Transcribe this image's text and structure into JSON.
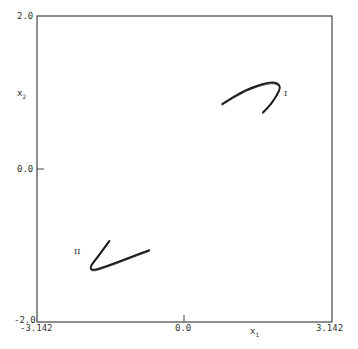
{
  "chart_data": {
    "type": "line",
    "title": "",
    "xlabel": "x1",
    "ylabel": "x2",
    "xlim": [
      -3.142,
      3.142
    ],
    "ylim": [
      -2.0,
      2.0
    ],
    "grid": false,
    "x_ticks": [
      "-3.142",
      "0.0",
      "3.142"
    ],
    "y_ticks": [
      "-2.0",
      "0.0",
      "2.0"
    ],
    "series": [
      {
        "name": "I",
        "points": [
          [
            0.8,
            0.85
          ],
          [
            1.3,
            1.04
          ],
          [
            1.82,
            1.14
          ],
          [
            2.0,
            1.12
          ],
          [
            2.05,
            1.05
          ],
          [
            1.85,
            0.85
          ],
          [
            1.67,
            0.74
          ]
        ],
        "label_position": [
          2.12,
          0.93
        ]
      },
      {
        "name": "II",
        "points": [
          [
            -1.6,
            -0.94
          ],
          [
            -1.85,
            -1.15
          ],
          [
            -2.01,
            -1.27
          ],
          [
            -1.98,
            -1.33
          ],
          [
            -1.7,
            -1.28
          ],
          [
            -1.1,
            -1.14
          ],
          [
            -0.75,
            -1.06
          ]
        ],
        "label_position": [
          -2.25,
          -1.2
        ]
      }
    ]
  },
  "labels": {
    "y_top": "2.0",
    "y_mid": "0.0",
    "y_bottom": "-2.0",
    "x_left": "-3.142",
    "x_mid": "0.0",
    "x_right": "3.142",
    "x_axis_main": "x",
    "x_axis_sub": "1",
    "y_axis_main": "x",
    "y_axis_sub": "2",
    "curve1": "I",
    "curve2": "II"
  }
}
